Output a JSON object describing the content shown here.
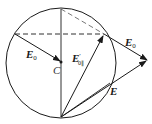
{
  "diagram": {
    "type": "vector-phasor-circle",
    "colors": {
      "stroke": "#1a1a1a",
      "background": "#ffffff"
    },
    "circle": {
      "cx": 61,
      "cy": 63,
      "r": 55
    },
    "labels": {
      "center": "C",
      "e0_left": {
        "main": "E",
        "sub": "0"
      },
      "e0_right": {
        "main": "E",
        "sub": "0"
      },
      "e_prime": {
        "main": "E",
        "prime": "′",
        "sub": "0∥"
      },
      "e_result": "E"
    },
    "elements": [
      {
        "id": "vertical-diameter",
        "style": "solid"
      },
      {
        "id": "horizontal-chord",
        "style": "dashed"
      },
      {
        "id": "top-to-tangent-point",
        "style": "dashed"
      },
      {
        "id": "arrow-e0-to-center",
        "style": "arrow",
        "label": "E0"
      },
      {
        "id": "arrow-e-prime",
        "style": "arrow",
        "label": "E'0∥"
      },
      {
        "id": "arrow-e0-outer",
        "style": "arrow",
        "label": "E0"
      },
      {
        "id": "arrow-e",
        "style": "arrow",
        "label": "E"
      },
      {
        "id": "chord-bottom-to-circle",
        "style": "solid"
      }
    ]
  }
}
